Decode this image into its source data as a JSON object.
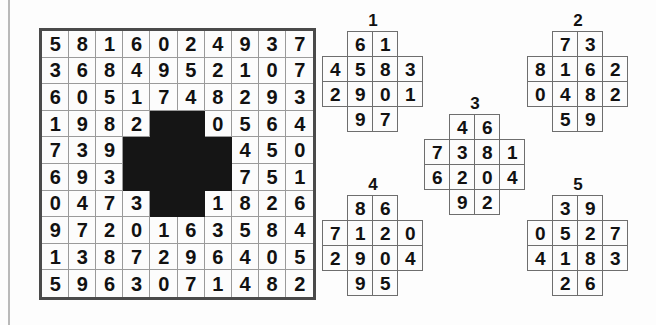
{
  "puzzle": {
    "kind": "number-grid-fit-puzzle",
    "main_grid": {
      "rows": 10,
      "cols": 10,
      "cells": [
        [
          "5",
          "8",
          "1",
          "6",
          "0",
          "2",
          "4",
          "9",
          "3",
          "7"
        ],
        [
          "3",
          "6",
          "8",
          "4",
          "9",
          "5",
          "2",
          "1",
          "0",
          "7"
        ],
        [
          "6",
          "0",
          "5",
          "1",
          "7",
          "4",
          "8",
          "2",
          "9",
          "3"
        ],
        [
          "1",
          "9",
          "8",
          "2",
          "",
          "",
          "0",
          "5",
          "6",
          "4"
        ],
        [
          "7",
          "3",
          "9",
          "",
          "",
          "",
          "",
          "4",
          "5",
          "0"
        ],
        [
          "6",
          "9",
          "3",
          "",
          "",
          "",
          "",
          "7",
          "5",
          "1"
        ],
        [
          "0",
          "4",
          "7",
          "3",
          "",
          "",
          "1",
          "8",
          "2",
          "6"
        ],
        [
          "9",
          "7",
          "2",
          "0",
          "1",
          "6",
          "3",
          "5",
          "8",
          "4"
        ],
        [
          "1",
          "3",
          "8",
          "7",
          "2",
          "9",
          "6",
          "4",
          "0",
          "5"
        ],
        [
          "5",
          "9",
          "6",
          "3",
          "0",
          "7",
          "1",
          "4",
          "8",
          "2"
        ]
      ],
      "hole_cells": [
        [
          3,
          4
        ],
        [
          3,
          5
        ],
        [
          4,
          3
        ],
        [
          4,
          4
        ],
        [
          4,
          5
        ],
        [
          4,
          6
        ],
        [
          5,
          3
        ],
        [
          5,
          4
        ],
        [
          5,
          5
        ],
        [
          5,
          6
        ],
        [
          6,
          4
        ],
        [
          6,
          5
        ]
      ],
      "hole_shape": "plus",
      "hole_color": "#151515",
      "cell_bg": "#fcfcfc",
      "border_color": "#4a4a4a",
      "grid_line_color": "#9a9a9a"
    },
    "pieces": [
      {
        "label": "1",
        "shape": "plus",
        "cells": [
          [
            "",
            "6",
            "1",
            ""
          ],
          [
            "4",
            "5",
            "8",
            "3"
          ],
          [
            "2",
            "9",
            "0",
            "1"
          ],
          [
            "",
            "9",
            "7",
            ""
          ]
        ]
      },
      {
        "label": "2",
        "shape": "plus",
        "cells": [
          [
            "",
            "7",
            "3",
            ""
          ],
          [
            "8",
            "1",
            "6",
            "2"
          ],
          [
            "0",
            "4",
            "8",
            "2"
          ],
          [
            "",
            "5",
            "9",
            ""
          ]
        ]
      },
      {
        "label": "3",
        "shape": "plus",
        "cells": [
          [
            "",
            "4",
            "6",
            ""
          ],
          [
            "7",
            "3",
            "8",
            "1"
          ],
          [
            "6",
            "2",
            "0",
            "4"
          ],
          [
            "",
            "9",
            "2",
            ""
          ]
        ]
      },
      {
        "label": "4",
        "shape": "plus",
        "cells": [
          [
            "",
            "8",
            "6",
            ""
          ],
          [
            "7",
            "1",
            "2",
            "0"
          ],
          [
            "2",
            "9",
            "0",
            "4"
          ],
          [
            "",
            "9",
            "5",
            ""
          ]
        ]
      },
      {
        "label": "5",
        "shape": "plus",
        "cells": [
          [
            "",
            "3",
            "9",
            ""
          ],
          [
            "0",
            "5",
            "2",
            "7"
          ],
          [
            "4",
            "1",
            "8",
            "3"
          ],
          [
            "",
            "2",
            "6",
            ""
          ]
        ]
      }
    ]
  }
}
